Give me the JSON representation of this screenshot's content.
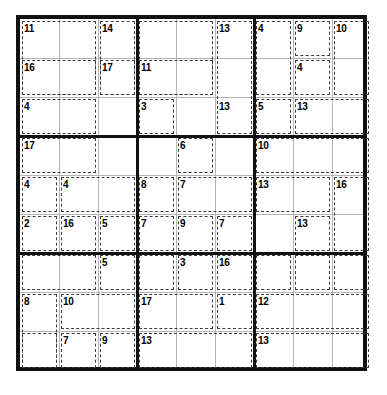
{
  "puzzle": {
    "type": "killer-sudoku",
    "grid_size": 9,
    "box_size": 3,
    "given_digits": [],
    "colors": {
      "frame": "#111111",
      "box_line": "#111111",
      "cell_line": "#b4b4b4",
      "cage_line": "#3c3c3c",
      "background": "#ffffff",
      "sum_text": "#000000"
    },
    "cages": [
      {
        "sum": "11",
        "cells": [
          [
            0,
            0
          ],
          [
            0,
            1
          ],
          [
            1,
            0
          ],
          [
            1,
            1
          ],
          [
            2,
            1
          ],
          [
            2,
            2
          ]
        ]
      },
      {
        "sum": "14",
        "cells": [
          [
            0,
            2
          ],
          [
            1,
            2
          ]
        ]
      },
      {
        "sum": "16",
        "cells": [
          [
            1,
            0
          ],
          [
            2,
            0
          ]
        ]
      },
      {
        "sum": "17",
        "cells": [
          [
            1,
            2
          ]
        ]
      },
      {
        "sum": "4",
        "cells": [
          [
            2,
            0
          ]
        ]
      },
      {
        "sum": "13",
        "cells": [
          [
            0,
            3
          ],
          [
            0,
            4
          ],
          [
            1,
            3
          ],
          [
            1,
            4
          ]
        ]
      },
      {
        "sum": "11",
        "cells": [
          [
            1,
            3
          ]
        ]
      },
      {
        "sum": "3",
        "cells": [
          [
            2,
            3
          ],
          [
            2,
            4
          ]
        ]
      },
      {
        "sum": "13",
        "cells": [
          [
            0,
            5
          ],
          [
            1,
            5
          ],
          [
            2,
            5
          ]
        ]
      },
      {
        "sum": "4",
        "cells": [
          [
            0,
            6
          ],
          [
            1,
            6
          ]
        ]
      },
      {
        "sum": "9",
        "cells": [
          [
            0,
            7
          ]
        ]
      },
      {
        "sum": "10",
        "cells": [
          [
            0,
            8
          ],
          [
            1,
            8
          ]
        ]
      },
      {
        "sum": "4",
        "cells": [
          [
            1,
            7
          ]
        ]
      },
      {
        "sum": "5",
        "cells": [
          [
            2,
            6
          ]
        ]
      },
      {
        "sum": "13",
        "cells": [
          [
            2,
            7
          ],
          [
            2,
            8
          ]
        ]
      },
      {
        "sum": "17",
        "cells": [
          [
            3,
            0
          ],
          [
            3,
            1
          ],
          [
            3,
            2
          ]
        ]
      },
      {
        "sum": "4",
        "cells": [
          [
            4,
            0
          ]
        ]
      },
      {
        "sum": "4",
        "cells": [
          [
            4,
            1
          ],
          [
            4,
            2
          ]
        ]
      },
      {
        "sum": "2",
        "cells": [
          [
            5,
            0
          ]
        ]
      },
      {
        "sum": "16",
        "cells": [
          [
            5,
            1
          ]
        ]
      },
      {
        "sum": "5",
        "cells": [
          [
            5,
            2
          ]
        ]
      },
      {
        "sum": "6",
        "cells": [
          [
            3,
            4
          ]
        ]
      },
      {
        "sum": "8",
        "cells": [
          [
            4,
            3
          ]
        ]
      },
      {
        "sum": "7",
        "cells": [
          [
            4,
            4
          ],
          [
            4,
            5
          ]
        ]
      },
      {
        "sum": "7",
        "cells": [
          [
            5,
            3
          ]
        ]
      },
      {
        "sum": "9",
        "cells": [
          [
            5,
            4
          ]
        ]
      },
      {
        "sum": "7",
        "cells": [
          [
            5,
            5
          ]
        ]
      },
      {
        "sum": "10",
        "cells": [
          [
            3,
            6
          ],
          [
            3,
            7
          ],
          [
            3,
            8
          ]
        ]
      },
      {
        "sum": "13",
        "cells": [
          [
            4,
            6
          ],
          [
            4,
            7
          ]
        ]
      },
      {
        "sum": "16",
        "cells": [
          [
            4,
            8
          ],
          [
            5,
            8
          ]
        ]
      },
      {
        "sum": "13",
        "cells": [
          [
            5,
            7
          ]
        ]
      },
      {
        "sum": "5",
        "cells": [
          [
            6,
            2
          ]
        ]
      },
      {
        "sum": "8",
        "cells": [
          [
            7,
            0
          ],
          [
            8,
            0
          ]
        ]
      },
      {
        "sum": "10",
        "cells": [
          [
            7,
            1
          ],
          [
            7,
            2
          ]
        ]
      },
      {
        "sum": "7",
        "cells": [
          [
            8,
            1
          ]
        ]
      },
      {
        "sum": "9",
        "cells": [
          [
            8,
            2
          ]
        ]
      },
      {
        "sum": "3",
        "cells": [
          [
            6,
            4
          ]
        ]
      },
      {
        "sum": "16",
        "cells": [
          [
            6,
            5
          ]
        ]
      },
      {
        "sum": "17",
        "cells": [
          [
            7,
            3
          ],
          [
            7,
            4
          ]
        ]
      },
      {
        "sum": "1",
        "cells": [
          [
            7,
            5
          ]
        ]
      },
      {
        "sum": "13",
        "cells": [
          [
            8,
            3
          ],
          [
            8,
            4
          ],
          [
            8,
            5
          ]
        ]
      },
      {
        "sum": "12",
        "cells": [
          [
            7,
            6
          ],
          [
            7,
            7
          ],
          [
            7,
            8
          ]
        ]
      },
      {
        "sum": "13",
        "cells": [
          [
            8,
            6
          ],
          [
            8,
            7
          ],
          [
            8,
            8
          ]
        ]
      }
    ]
  },
  "cage_boxes": [
    {
      "name": "cage-11-r1c1",
      "sum": "11",
      "x": 0,
      "y": 0,
      "w": 78,
      "h": 78,
      "sx": 3,
      "sy": 2
    },
    {
      "name": "cage-14-r1c3",
      "sum": "14",
      "x": 78,
      "y": 0,
      "w": 39,
      "h": 78,
      "sx": 81,
      "sy": 2
    },
    {
      "name": "cage-16-r2c1",
      "sum": "16",
      "x": 0,
      "y": 39,
      "w": 78,
      "h": 39,
      "sx": 3,
      "sy": 41
    },
    {
      "name": "cage-17-r2c3",
      "sum": "17",
      "x": 78,
      "y": 39,
      "w": 39,
      "h": 39,
      "sx": 81,
      "sy": 41
    },
    {
      "name": "cage-4-r3c1",
      "sum": "4",
      "x": 0,
      "y": 78,
      "w": 78,
      "h": 39,
      "sx": 3,
      "sy": 80
    },
    {
      "name": "cage-13-r1c4",
      "sum": "13",
      "x": 117,
      "y": 0,
      "w": 78,
      "h": 78,
      "sx": 198,
      "sy": 2
    },
    {
      "name": "cage-11-r2c4",
      "sum": "11",
      "x": 117,
      "y": 39,
      "w": 78,
      "h": 39,
      "sx": 120,
      "sy": 41
    },
    {
      "name": "cage-3-r3c4",
      "sum": "3",
      "x": 117,
      "y": 78,
      "w": 39,
      "h": 39,
      "sx": 120,
      "sy": 80
    },
    {
      "name": "cage-13-r1c6",
      "sum": "13",
      "x": 195,
      "y": 0,
      "w": 39,
      "h": 117,
      "sx": 198,
      "sy": 80
    },
    {
      "name": "cage-4-r1c7",
      "sum": "4",
      "x": 234,
      "y": 0,
      "w": 39,
      "h": 78,
      "sx": 237,
      "sy": 2
    },
    {
      "name": "cage-9-r1c8",
      "sum": "9",
      "x": 273,
      "y": 0,
      "w": 39,
      "h": 39,
      "sx": 276,
      "sy": 2
    },
    {
      "name": "cage-10-r1c9",
      "sum": "10",
      "x": 312,
      "y": 0,
      "w": 39,
      "h": 78,
      "sx": 315,
      "sy": 2
    },
    {
      "name": "cage-4-r2c8",
      "sum": "4",
      "x": 273,
      "y": 39,
      "w": 39,
      "h": 39,
      "sx": 276,
      "sy": 41
    },
    {
      "name": "cage-5-r3c7",
      "sum": "5",
      "x": 234,
      "y": 78,
      "w": 39,
      "h": 39,
      "sx": 237,
      "sy": 80
    },
    {
      "name": "cage-13-r3c8",
      "sum": "13",
      "x": 273,
      "y": 78,
      "w": 78,
      "h": 39,
      "sx": 276,
      "sy": 80
    },
    {
      "name": "cage-17-r4c1",
      "sum": "17",
      "x": 0,
      "y": 117,
      "w": 78,
      "h": 39,
      "sx": 3,
      "sy": 119
    },
    {
      "name": "cage-4-r5c1",
      "sum": "4",
      "x": 0,
      "y": 156,
      "w": 39,
      "h": 39,
      "sx": 3,
      "sy": 158
    },
    {
      "name": "cage-4-r5c2",
      "sum": "4",
      "x": 39,
      "y": 156,
      "w": 78,
      "h": 39,
      "sx": 42,
      "sy": 158
    },
    {
      "name": "cage-2-r6c1",
      "sum": "2",
      "x": 0,
      "y": 195,
      "w": 39,
      "h": 39,
      "sx": 3,
      "sy": 197
    },
    {
      "name": "cage-16-r6c2",
      "sum": "16",
      "x": 39,
      "y": 195,
      "w": 39,
      "h": 39,
      "sx": 42,
      "sy": 197
    },
    {
      "name": "cage-5-r6c3",
      "sum": "5",
      "x": 78,
      "y": 195,
      "w": 39,
      "h": 39,
      "sx": 81,
      "sy": 197
    },
    {
      "name": "cage-6-r4c5",
      "sum": "6",
      "x": 156,
      "y": 117,
      "w": 39,
      "h": 39,
      "sx": 159,
      "sy": 119
    },
    {
      "name": "cage-8-r5c4",
      "sum": "8",
      "x": 117,
      "y": 156,
      "w": 39,
      "h": 39,
      "sx": 120,
      "sy": 158
    },
    {
      "name": "cage-7-r5c5",
      "sum": "7",
      "x": 156,
      "y": 156,
      "w": 78,
      "h": 39,
      "sx": 159,
      "sy": 158
    },
    {
      "name": "cage-7-r6c4",
      "sum": "7",
      "x": 117,
      "y": 195,
      "w": 39,
      "h": 39,
      "sx": 120,
      "sy": 197
    },
    {
      "name": "cage-9-r6c5",
      "sum": "9",
      "x": 156,
      "y": 195,
      "w": 39,
      "h": 39,
      "sx": 159,
      "sy": 197
    },
    {
      "name": "cage-7-r6c6",
      "sum": "7",
      "x": 195,
      "y": 195,
      "w": 39,
      "h": 39,
      "sx": 198,
      "sy": 197
    },
    {
      "name": "cage-10-r4c7",
      "sum": "10",
      "x": 234,
      "y": 117,
      "w": 117,
      "h": 39,
      "sx": 237,
      "sy": 119
    },
    {
      "name": "cage-13-r5c7",
      "sum": "13",
      "x": 234,
      "y": 156,
      "w": 78,
      "h": 39,
      "sx": 237,
      "sy": 158
    },
    {
      "name": "cage-16-r5c9",
      "sum": "16",
      "x": 312,
      "y": 156,
      "w": 39,
      "h": 78,
      "sx": 315,
      "sy": 158
    },
    {
      "name": "cage-13-r6c8",
      "sum": "13",
      "x": 273,
      "y": 195,
      "w": 39,
      "h": 39,
      "sx": 276,
      "sy": 197
    },
    {
      "name": "cage-5-r7c3",
      "sum": "5",
      "x": 78,
      "y": 234,
      "w": 39,
      "h": 39,
      "sx": 81,
      "sy": 236
    },
    {
      "name": "cage-8-r8c1",
      "sum": "8",
      "x": 0,
      "y": 273,
      "w": 39,
      "h": 78,
      "sx": 3,
      "sy": 275
    },
    {
      "name": "cage-10-r8c2",
      "sum": "10",
      "x": 39,
      "y": 273,
      "w": 78,
      "h": 39,
      "sx": 42,
      "sy": 275
    },
    {
      "name": "cage-7-r9c2",
      "sum": "7",
      "x": 39,
      "y": 312,
      "w": 39,
      "h": 39,
      "sx": 42,
      "sy": 314
    },
    {
      "name": "cage-9-r9c3",
      "sum": "9",
      "x": 78,
      "y": 312,
      "w": 39,
      "h": 39,
      "sx": 81,
      "sy": 314
    },
    {
      "name": "cage-3-r7c5",
      "sum": "3",
      "x": 156,
      "y": 234,
      "w": 39,
      "h": 39,
      "sx": 159,
      "sy": 236
    },
    {
      "name": "cage-16-r7c6",
      "sum": "16",
      "x": 195,
      "y": 234,
      "w": 39,
      "h": 39,
      "sx": 198,
      "sy": 236
    },
    {
      "name": "cage-17-r8c4",
      "sum": "17",
      "x": 117,
      "y": 273,
      "w": 78,
      "h": 39,
      "sx": 120,
      "sy": 275
    },
    {
      "name": "cage-1-r8c6",
      "sum": "1",
      "x": 195,
      "y": 273,
      "w": 39,
      "h": 39,
      "sx": 198,
      "sy": 275
    },
    {
      "name": "cage-13-r9c4",
      "sum": "13",
      "x": 117,
      "y": 312,
      "w": 117,
      "h": 39,
      "sx": 120,
      "sy": 314
    },
    {
      "name": "cage-12-r8c7",
      "sum": "12",
      "x": 234,
      "y": 273,
      "w": 117,
      "h": 39,
      "sx": 237,
      "sy": 275
    },
    {
      "name": "cage-13-r9c7",
      "sum": "13",
      "x": 234,
      "y": 312,
      "w": 117,
      "h": 39,
      "sx": 237,
      "sy": 314
    },
    {
      "name": "cage-r7c7",
      "sum": "",
      "x": 234,
      "y": 234,
      "w": 39,
      "h": 39,
      "sx": 237,
      "sy": 236
    },
    {
      "name": "cage-r7c8",
      "sum": "",
      "x": 273,
      "y": 234,
      "w": 39,
      "h": 39,
      "sx": 276,
      "sy": 236
    },
    {
      "name": "cage-r7c9",
      "sum": "",
      "x": 312,
      "y": 234,
      "w": 39,
      "h": 39,
      "sx": 315,
      "sy": 236
    },
    {
      "name": "cage-r7c1",
      "sum": "",
      "x": 0,
      "y": 234,
      "w": 78,
      "h": 39,
      "sx": 3,
      "sy": 236
    },
    {
      "name": "cage-r9c1",
      "sum": "",
      "x": 0,
      "y": 312,
      "w": 39,
      "h": 39,
      "sx": 3,
      "sy": 314
    },
    {
      "name": "cage-r7c4",
      "sum": "",
      "x": 117,
      "y": 234,
      "w": 39,
      "h": 39,
      "sx": 120,
      "sy": 236
    }
  ]
}
